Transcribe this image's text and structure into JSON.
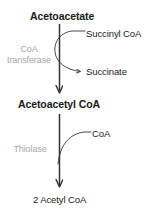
{
  "diagram": {
    "colors": {
      "text": "#1a1a1a",
      "enzyme": "#a6a6a6",
      "arrow": "#333333",
      "background": "#ffffff"
    },
    "steps": [
      {
        "substrate": "Acetoacetate",
        "enzyme_line1": "CoA",
        "enzyme_line2": "transferase",
        "cofactor_in": "Succinyl CoA",
        "cofactor_out": "Succinate",
        "product": "Acetoacetyl CoA"
      },
      {
        "substrate": "Acetoacetyl CoA",
        "enzyme_line1": "Thiolase",
        "enzyme_line2": "",
        "cofactor_in": "CoA",
        "cofactor_out": "",
        "product": "2 Acetyl CoA"
      }
    ],
    "labels": {
      "acetoacetate": "Acetoacetate",
      "succinyl_coa": "Succinyl CoA",
      "coa_transferase_line1": "CoA",
      "coa_transferase_line2": "transferase",
      "succinate": "Succinate",
      "acetoacetyl_coa": "Acetoacetyl CoA",
      "thiolase": "Thiolase",
      "coa": "CoA",
      "acetyl_coa": "2 Acetyl CoA"
    }
  }
}
